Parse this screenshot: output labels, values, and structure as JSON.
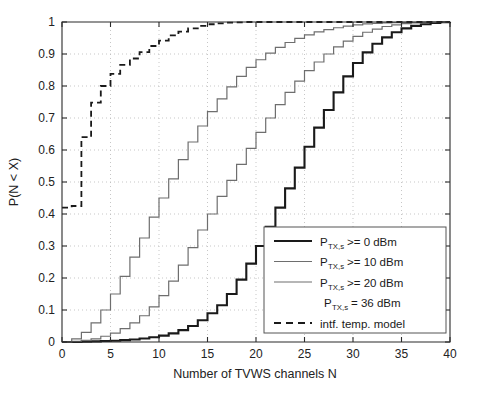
{
  "chart_data": {
    "type": "line",
    "title": "",
    "xlabel": "Number of TVWS channels N",
    "ylabel": "P(N < X)",
    "xlim": [
      0,
      40
    ],
    "ylim": [
      0,
      1
    ],
    "xticks": [
      0,
      5,
      10,
      15,
      20,
      25,
      30,
      35,
      40
    ],
    "xtick_labels": [
      "0",
      "5",
      "10",
      "15",
      "20",
      "25",
      "30",
      "35",
      "40"
    ],
    "yticks": [
      0,
      0.1,
      0.2,
      0.3,
      0.4,
      0.5,
      0.6,
      0.7,
      0.8,
      0.9,
      1
    ],
    "ytick_labels": [
      "0",
      "0.1",
      "0.2",
      "0.3",
      "0.4",
      "0.5",
      "0.6",
      "0.7",
      "0.8",
      "0.9",
      "1"
    ],
    "grid": true,
    "grid_style": "dotted",
    "legend_position": "lower-right",
    "series": [
      {
        "name": "P_TX,s >= 0 dBm",
        "style": "step",
        "color": "#1a1a1a",
        "width": 2.1,
        "dash": "none",
        "x": [
          0,
          1,
          2,
          3,
          4,
          5,
          6,
          7,
          8,
          9,
          10,
          11,
          12,
          13,
          14,
          15,
          16,
          17,
          18,
          19,
          20,
          21,
          22,
          23,
          24,
          25,
          26,
          27,
          28,
          29,
          30,
          31,
          32,
          33,
          34,
          35,
          36,
          37,
          38,
          39,
          40
        ],
        "y": [
          0.0,
          0.0,
          0.001,
          0.002,
          0.003,
          0.004,
          0.006,
          0.008,
          0.011,
          0.015,
          0.02,
          0.027,
          0.037,
          0.05,
          0.068,
          0.09,
          0.115,
          0.15,
          0.195,
          0.245,
          0.3,
          0.36,
          0.42,
          0.48,
          0.545,
          0.61,
          0.67,
          0.725,
          0.78,
          0.83,
          0.872,
          0.905,
          0.932,
          0.952,
          0.968,
          0.98,
          0.988,
          0.993,
          0.997,
          0.999,
          1.0
        ]
      },
      {
        "name": "P_TX,s >= 10 dBm",
        "style": "step",
        "color": "#6e6e6e",
        "width": 1.2,
        "dash": "none",
        "x": [
          0,
          1,
          2,
          3,
          4,
          5,
          6,
          7,
          8,
          9,
          10,
          11,
          12,
          13,
          14,
          15,
          16,
          17,
          18,
          19,
          20,
          21,
          22,
          23,
          24,
          25,
          26,
          27,
          28,
          29,
          30,
          31,
          32,
          33,
          34,
          35,
          36,
          37,
          38,
          39,
          40
        ],
        "y": [
          0.0,
          0.002,
          0.005,
          0.01,
          0.018,
          0.028,
          0.042,
          0.06,
          0.082,
          0.11,
          0.145,
          0.19,
          0.24,
          0.295,
          0.35,
          0.4,
          0.455,
          0.505,
          0.555,
          0.605,
          0.655,
          0.7,
          0.742,
          0.78,
          0.815,
          0.848,
          0.875,
          0.9,
          0.922,
          0.94,
          0.955,
          0.968,
          0.978,
          0.986,
          0.991,
          0.995,
          0.997,
          0.999,
          0.999,
          1.0,
          1.0
        ]
      },
      {
        "name": "P_TX,s >= 20 dBm",
        "style": "step",
        "color": "#6e6e6e",
        "width": 1.2,
        "dash": "none",
        "x": [
          0,
          1,
          2,
          3,
          4,
          5,
          6,
          7,
          8,
          9,
          10,
          11,
          12,
          13,
          14,
          15,
          16,
          17,
          18,
          19,
          20,
          21,
          22,
          23,
          24,
          25,
          26,
          27,
          28,
          29,
          30,
          31,
          32,
          33,
          34,
          35,
          36,
          37,
          38,
          39,
          40
        ],
        "y": [
          0.0,
          0.01,
          0.03,
          0.06,
          0.1,
          0.15,
          0.205,
          0.265,
          0.325,
          0.39,
          0.45,
          0.51,
          0.57,
          0.625,
          0.675,
          0.72,
          0.76,
          0.797,
          0.83,
          0.858,
          0.882,
          0.903,
          0.921,
          0.936,
          0.949,
          0.96,
          0.969,
          0.976,
          0.982,
          0.987,
          0.991,
          0.994,
          0.996,
          0.997,
          0.998,
          0.999,
          0.999,
          1.0,
          1.0,
          1.0,
          1.0
        ]
      },
      {
        "name": "P_TX,s = 36 dBm",
        "style": "none",
        "color": "#1a1a1a",
        "width": 0,
        "dash": "none",
        "x": [],
        "y": []
      },
      {
        "name": "intf. temp. model",
        "style": "step",
        "color": "#1a1a1a",
        "width": 1.8,
        "dash": "6 4",
        "x": [
          0,
          1,
          2,
          3,
          4,
          5,
          6,
          7,
          8,
          9,
          10,
          11,
          12,
          13,
          14,
          15,
          16,
          17,
          18,
          19,
          20,
          40
        ],
        "y": [
          0.42,
          0.425,
          0.64,
          0.748,
          0.8,
          0.838,
          0.866,
          0.886,
          0.906,
          0.925,
          0.942,
          0.958,
          0.97,
          0.98,
          0.988,
          0.993,
          0.996,
          0.998,
          0.999,
          1.0,
          1.0,
          1.0
        ]
      }
    ]
  },
  "legend": {
    "entries": [
      {
        "base": "P",
        "sub": "TX,s",
        "rest": ">= 0 dBm",
        "sample": "solid-thick"
      },
      {
        "base": "P",
        "sub": "TX,s",
        "rest": ">= 10 dBm",
        "sample": "solid-thin"
      },
      {
        "base": "P",
        "sub": "TX,s",
        "rest": ">= 20 dBm",
        "sample": "solid-thin"
      },
      {
        "base": "P",
        "sub": "TX,s",
        "rest": "= 36 dBm",
        "sample": "none"
      },
      {
        "base": "",
        "sub": "",
        "rest": "intf. temp. model",
        "sample": "dashed"
      }
    ]
  }
}
